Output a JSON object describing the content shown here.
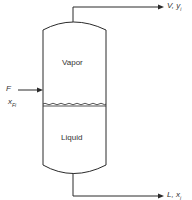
{
  "diagram": {
    "type": "flash-drum",
    "regions": {
      "vapor_label": "Vapor",
      "liquid_label": "Liquid"
    },
    "streams": {
      "feed": {
        "label": "F",
        "composition_base": "x",
        "composition_sub": "Fi"
      },
      "vapor_out": {
        "label": "V, y",
        "composition_sub": "i"
      },
      "liquid_out": {
        "label": "L, x",
        "composition_sub": "i"
      }
    },
    "colors": {
      "line": "#2a2a2a",
      "text": "#333333"
    }
  }
}
